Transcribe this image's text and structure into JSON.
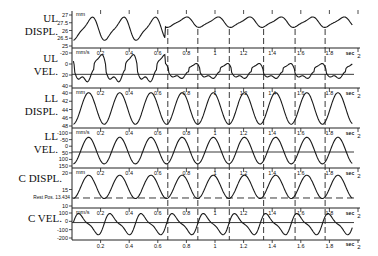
{
  "chart_data": {
    "type": "line",
    "title": "",
    "xlabel": "sec",
    "xlim": [
      0,
      2
    ],
    "x_ticks": [
      0.2,
      0.4,
      0.6,
      0.8,
      1,
      1.2,
      1.4,
      1.6,
      1.8,
      2
    ],
    "x_tick_labels": [
      "0.2",
      "0.4",
      "0.6",
      "0.8",
      "1",
      "1.2",
      "1.4",
      "1.6",
      "1.8",
      "2"
    ],
    "x_unit_label": "sec",
    "dashed_vertical_markers_sec": [
      0.67,
      0.88,
      1.1,
      1.34,
      1.56,
      1.77
    ],
    "grid": false,
    "legend": null,
    "panels": [
      {
        "name": "ul-displ",
        "label_lines": [
          "UL",
          "DISPL."
        ],
        "unit": "mm",
        "y_tick_labels": [
          "27",
          "27.5",
          "26",
          "26.5",
          "25"
        ],
        "ylim": [
          25,
          27.5
        ],
        "zero_line": false,
        "waveform": {
          "kind": "ul_displ",
          "period_sec": 0.22,
          "mean": 26.3,
          "amp": 0.8,
          "damp_after_sec": 0.65
        }
      },
      {
        "name": "ul-vel",
        "label_lines": [
          "UL",
          "VEL."
        ],
        "unit": "mm/s",
        "y_tick_labels": [
          "-20",
          "0",
          "20",
          "40"
        ],
        "ylim": [
          -20,
          40
        ],
        "zero_line": true,
        "waveform": {
          "kind": "ul_vel",
          "period_sec": 0.22,
          "mean": 0,
          "amp": 20
        }
      },
      {
        "name": "ll-displ",
        "label_lines": [
          "LL",
          "DISPL."
        ],
        "unit": "mm",
        "y_tick_labels": [
          "40",
          "42",
          "44",
          "46",
          "48"
        ],
        "ylim": [
          40,
          48
        ],
        "zero_line": false,
        "waveform": {
          "kind": "sine",
          "period_sec": 0.218,
          "mean": 44,
          "amp": 3.6
        }
      },
      {
        "name": "ll-vel",
        "label_lines": [
          "LL",
          "VEL."
        ],
        "unit": "mm/s",
        "y_tick_labels": [
          "-100",
          "-50",
          "0",
          "50",
          "100",
          "150"
        ],
        "ylim": [
          -100,
          150
        ],
        "zero_line": true,
        "waveform": {
          "kind": "sine",
          "period_sec": 0.218,
          "mean": 10,
          "amp": 95
        }
      },
      {
        "name": "c-displ",
        "label_lines": [
          "C DISPL."
        ],
        "unit": "mm",
        "y_tick_labels": [
          "20",
          "15",
          "10"
        ],
        "ylim": [
          10,
          25
        ],
        "zero_line": false,
        "rest_position": {
          "label": "Rest Pos. 13.434",
          "value": 13.434
        },
        "waveform": {
          "kind": "sine",
          "period_sec": 0.218,
          "mean": 18.2,
          "amp": 5
        }
      },
      {
        "name": "c-vel",
        "label_lines": [
          "C VEL."
        ],
        "unit": "mm/s",
        "y_tick_labels": [
          "100",
          "0",
          "-100",
          "-200"
        ],
        "ylim": [
          -200,
          150
        ],
        "zero_line": true,
        "waveform": {
          "kind": "skew",
          "period_sec": 0.218,
          "mean": -20,
          "amp": 150
        }
      }
    ]
  },
  "colors": {
    "line": "#1a1a1a",
    "axis": "#222222",
    "background": "#ffffff"
  }
}
